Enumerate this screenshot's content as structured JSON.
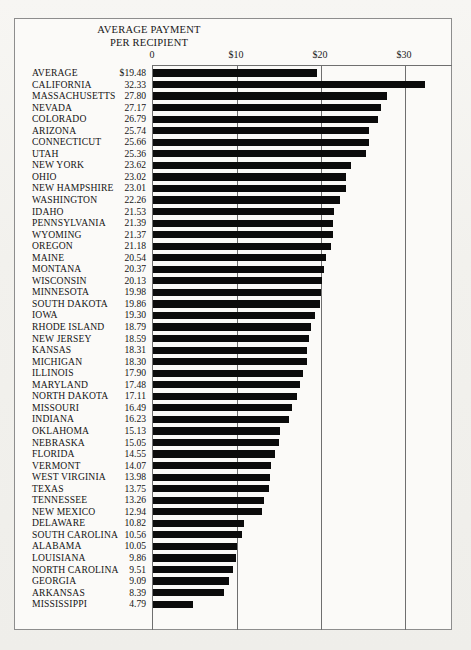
{
  "chart_data": {
    "type": "bar",
    "orientation": "horizontal",
    "title": "AVERAGE PAYMENT\nPER RECIPIENT",
    "xlabel": "",
    "ylabel": "",
    "xlim": [
      0,
      35.7
    ],
    "grid": true,
    "legend": null,
    "tick_labels": [
      "0",
      "$10",
      "$20",
      "$30"
    ],
    "tick_values": [
      0,
      10,
      20,
      30
    ],
    "value_prefix_first_row": "$",
    "categories": [
      "AVERAGE",
      "CALIFORNIA",
      "MASSACHUSETTS",
      "NEVADA",
      "COLORADO",
      "ARIZONA",
      "CONNECTICUT",
      "UTAH",
      "NEW YORK",
      "OHIO",
      "NEW HAMPSHIRE",
      "WASHINGTON",
      "IDAHO",
      "PENNSYLVANIA",
      "WYOMING",
      "OREGON",
      "MAINE",
      "MONTANA",
      "WISCONSIN",
      "MINNESOTA",
      "SOUTH DAKOTA",
      "IOWA",
      "RHODE ISLAND",
      "NEW JERSEY",
      "KANSAS",
      "MICHIGAN",
      "ILLINOIS",
      "MARYLAND",
      "NORTH DAKOTA",
      "MISSOURI",
      "INDIANA",
      "OKLAHOMA",
      "NEBRASKA",
      "FLORIDA",
      "VERMONT",
      "WEST VIRGINIA",
      "TEXAS",
      "TENNESSEE",
      "NEW MEXICO",
      "DELAWARE",
      "SOUTH CAROLINA",
      "ALABAMA",
      "LOUISIANA",
      "NORTH CAROLINA",
      "GEORGIA",
      "ARKANSAS",
      "MISSISSIPPI"
    ],
    "values": [
      19.48,
      32.33,
      27.8,
      27.17,
      26.79,
      25.74,
      25.66,
      25.36,
      23.62,
      23.02,
      23.01,
      22.26,
      21.53,
      21.39,
      21.37,
      21.18,
      20.54,
      20.37,
      20.13,
      19.98,
      19.86,
      19.3,
      18.79,
      18.59,
      18.31,
      18.3,
      17.9,
      17.48,
      17.11,
      16.49,
      16.23,
      15.13,
      15.05,
      14.55,
      14.07,
      13.98,
      13.75,
      13.26,
      12.94,
      10.82,
      10.56,
      10.05,
      9.86,
      9.51,
      9.09,
      8.39,
      4.79
    ],
    "value_labels": [
      "$19.48",
      "32.33",
      "27.80",
      "27.17",
      "26.79",
      "25.74",
      "25.66",
      "25.36",
      "23.62",
      "23.02",
      "23.01",
      "22.26",
      "21.53",
      "21.39",
      "21.37",
      "21.18",
      "20.54",
      "20.37",
      "20.13",
      "19.98",
      "19.86",
      "19.30",
      "18.79",
      "18.59",
      "18.31",
      "18.30",
      "17.90",
      "17.48",
      "17.11",
      "16.49",
      "16.23",
      "15.13",
      "15.05",
      "14.55",
      "14.07",
      "13.98",
      "13.75",
      "13.26",
      "12.94",
      "10.82",
      "10.56",
      "10.05",
      "9.86",
      "9.51",
      "9.09",
      "8.39",
      "4.79"
    ],
    "bar_color": "#0b0b0b",
    "frame_color": "#8d8d8d",
    "gridline_color": "#6f6f6f"
  }
}
